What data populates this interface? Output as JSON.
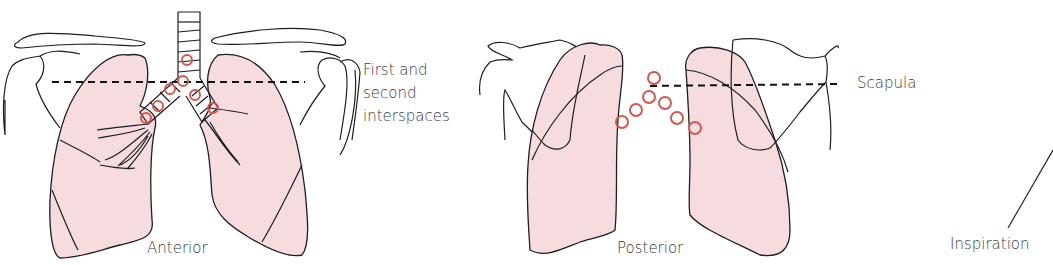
{
  "figure": {
    "panels": [
      {
        "id": "anterior",
        "label": "Anterior"
      },
      {
        "id": "posterior",
        "label": "Posterior"
      },
      {
        "id": "inspiration",
        "label": "Inspiration"
      }
    ],
    "annotations": {
      "interspaces_line1": "First and",
      "interspaces_line2": "second",
      "interspaces_line3": "interspaces",
      "scapula": "Scapula"
    },
    "colors": {
      "lung_fill": "#f6dcdf",
      "marker_ring": "#d0584f",
      "outline": "#1e1e1e"
    },
    "markers": {
      "anterior": [
        [
          187,
          60
        ],
        [
          183,
          81
        ],
        [
          170,
          89
        ],
        [
          158,
          106
        ],
        [
          146,
          118
        ],
        [
          195,
          95
        ],
        [
          213,
          108
        ]
      ],
      "posterior": [
        [
          654,
          78
        ],
        [
          649,
          97
        ],
        [
          636,
          110
        ],
        [
          622,
          122
        ],
        [
          665,
          103
        ],
        [
          677,
          118
        ],
        [
          695,
          128
        ]
      ]
    }
  }
}
